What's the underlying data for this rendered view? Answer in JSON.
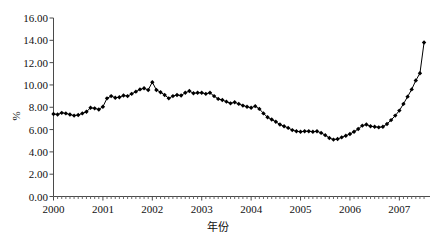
{
  "chart_data": {
    "type": "line",
    "title": "",
    "xlabel": "年份",
    "ylabel": "%",
    "ylim": [
      0,
      16
    ],
    "yticks": [
      "0.00",
      "2.00",
      "4.00",
      "6.00",
      "8.00",
      "10.00",
      "12.00",
      "14.00",
      "16.00"
    ],
    "ytick_values": [
      0,
      2,
      4,
      6,
      8,
      10,
      12,
      14,
      16
    ],
    "xticks": [
      "2000",
      "2001",
      "2002",
      "2003",
      "2004",
      "2005",
      "2006",
      "2007"
    ],
    "xtick_values": [
      2000,
      2001,
      2002,
      2003,
      2004,
      2005,
      2006,
      2007
    ],
    "xlim": [
      2000,
      2007.58
    ],
    "grid": false,
    "legend": "none",
    "marker": "diamond",
    "line_color": "#000000",
    "marker_color": "#000000",
    "minor_xticks": "monthly",
    "x": [
      2000.0,
      2000.083,
      2000.167,
      2000.25,
      2000.333,
      2000.417,
      2000.5,
      2000.583,
      2000.667,
      2000.75,
      2000.833,
      2000.917,
      2001.0,
      2001.083,
      2001.167,
      2001.25,
      2001.333,
      2001.417,
      2001.5,
      2001.583,
      2001.667,
      2001.75,
      2001.833,
      2001.917,
      2002.0,
      2002.083,
      2002.167,
      2002.25,
      2002.333,
      2002.417,
      2002.5,
      2002.583,
      2002.667,
      2002.75,
      2002.833,
      2002.917,
      2003.0,
      2003.083,
      2003.167,
      2003.25,
      2003.333,
      2003.417,
      2003.5,
      2003.583,
      2003.667,
      2003.75,
      2003.833,
      2003.917,
      2004.0,
      2004.083,
      2004.167,
      2004.25,
      2004.333,
      2004.417,
      2004.5,
      2004.583,
      2004.667,
      2004.75,
      2004.833,
      2004.917,
      2005.0,
      2005.083,
      2005.167,
      2005.25,
      2005.333,
      2005.417,
      2005.5,
      2005.583,
      2005.667,
      2005.75,
      2005.833,
      2005.917,
      2006.0,
      2006.083,
      2006.167,
      2006.25,
      2006.333,
      2006.417,
      2006.5,
      2006.583,
      2006.667,
      2006.75,
      2006.833,
      2006.917,
      2007.0,
      2007.083,
      2007.167,
      2007.25,
      2007.333,
      2007.417,
      2007.5
    ],
    "values": [
      7.4,
      7.35,
      7.5,
      7.45,
      7.35,
      7.25,
      7.3,
      7.45,
      7.6,
      7.95,
      7.9,
      7.8,
      8.05,
      8.8,
      9.0,
      8.85,
      8.9,
      9.05,
      9.0,
      9.2,
      9.4,
      9.6,
      9.7,
      9.55,
      10.25,
      9.55,
      9.35,
      9.1,
      8.8,
      9.0,
      9.1,
      9.05,
      9.3,
      9.45,
      9.25,
      9.3,
      9.3,
      9.2,
      9.3,
      9.0,
      8.75,
      8.65,
      8.5,
      8.35,
      8.45,
      8.3,
      8.15,
      8.05,
      7.95,
      8.1,
      7.85,
      7.45,
      7.1,
      6.9,
      6.7,
      6.45,
      6.3,
      6.15,
      5.95,
      5.85,
      5.8,
      5.85,
      5.85,
      5.8,
      5.85,
      5.7,
      5.5,
      5.25,
      5.1,
      5.15,
      5.3,
      5.45,
      5.6,
      5.8,
      6.05,
      6.35,
      6.45,
      6.3,
      6.25,
      6.2,
      6.25,
      6.5,
      6.85,
      7.25,
      7.7,
      8.3,
      8.95,
      9.6,
      10.4,
      11.05,
      13.8
    ]
  }
}
